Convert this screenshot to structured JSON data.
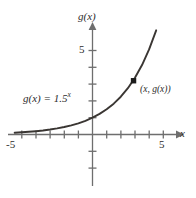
{
  "figure": {
    "name": "exponential-function-graph",
    "background_color": "#ffffff",
    "axis_color": "#6e6e6e",
    "curve_color": "#3a3633",
    "text_color": "#2b2b2b",
    "marker_color": "#1c1c1c"
  },
  "labels": {
    "y_axis": "g(x)",
    "x_axis": "x",
    "equation_fn": "g(x) = 1.5",
    "equation_exponent": "x",
    "point": "(x, g(x))"
  },
  "chart_data": {
    "type": "line",
    "title": "",
    "subtitle": "",
    "xlabel": "x",
    "ylabel": "g(x)",
    "function": "g(x) = 1.5^x",
    "base": 1.5,
    "grid": false,
    "legend": null,
    "xlim": [
      -5.9,
      6.2
    ],
    "ylim": [
      -3.1,
      6.5
    ],
    "x_tick_labels": [
      {
        "value": -5,
        "text": "-5"
      },
      {
        "value": 5,
        "text": "5"
      }
    ],
    "y_tick_labels": [
      {
        "value": 5,
        "text": "5"
      }
    ],
    "x_ticks": [
      -5,
      -4,
      -3,
      -2,
      -1,
      1,
      2,
      3,
      4,
      5
    ],
    "y_ticks": [
      -2,
      -1,
      1,
      2,
      3,
      4,
      5
    ],
    "x": [
      -5.5,
      -5,
      -4.5,
      -4,
      -3.5,
      -3,
      -2.5,
      -2,
      -1.5,
      -1,
      -0.5,
      0,
      0.5,
      1,
      1.5,
      2,
      2.5,
      3,
      3.5,
      4,
      4.5,
      5
    ],
    "y": [
      0.16,
      0.13,
      0.16,
      0.2,
      0.24,
      0.3,
      0.36,
      0.44,
      0.54,
      0.67,
      0.82,
      1.0,
      1.22,
      1.5,
      1.84,
      2.25,
      2.76,
      3.38,
      4.13,
      5.06,
      6.2,
      7.59
    ],
    "annotations": [
      {
        "name": "point-marker",
        "label": "(x, g(x))",
        "x": 2.9,
        "y": 3.2,
        "marker": "square"
      },
      {
        "name": "equation-label",
        "label": "g(x) = 1.5^x",
        "x": -3.8,
        "y": 2.5
      }
    ]
  }
}
